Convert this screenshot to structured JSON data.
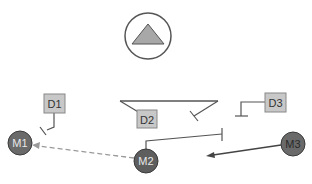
{
  "diagram": {
    "top_symbol": {
      "shape": "circle-with-triangle",
      "icon": "triangle-up-icon"
    },
    "demand_nodes": [
      {
        "id": "D1",
        "label": "D1"
      },
      {
        "id": "D2",
        "label": "D2"
      },
      {
        "id": "D3",
        "label": "D3"
      }
    ],
    "member_nodes": [
      {
        "id": "M1",
        "label": "M1"
      },
      {
        "id": "M2",
        "label": "M2"
      },
      {
        "id": "M3",
        "label": "M3"
      }
    ],
    "edges": [
      {
        "from": "M2",
        "to": "M1",
        "style": "dashed",
        "arrow": true
      },
      {
        "from": "M3",
        "to": "M2",
        "style": "solid",
        "arrow": true
      },
      {
        "from": "D1",
        "to": "M1",
        "style": "inhibit"
      },
      {
        "from": "D2",
        "to": "D2-tray",
        "style": "inhibit"
      },
      {
        "from": "D3",
        "to": "D3-ground",
        "style": "inhibit"
      },
      {
        "from": "M2",
        "to": "M2-bar",
        "style": "inhibit"
      }
    ],
    "colors": {
      "node_box_fill": "#c8c8c8",
      "node_box_stroke": "#888888",
      "member_fill": "#6a6a6a",
      "member_stroke": "#3a3a3a",
      "line": "#555555",
      "dashed": "#9a9a9a",
      "triangle_fill": "#a8a8a8"
    }
  }
}
